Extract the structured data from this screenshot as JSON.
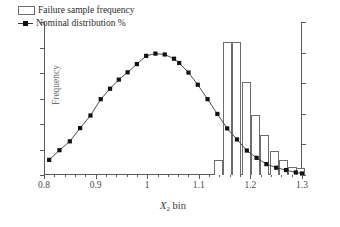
{
  "chart_data": {
    "type": "bar",
    "title": "",
    "subtitle": "",
    "xlabel": "X_2 bin",
    "xlabel_parts": {
      "italic": "X",
      "sub": "2",
      "rest": " bin"
    },
    "ylabel": "Frequency",
    "ylabel_right": "",
    "xlim": [
      0.8,
      1.3
    ],
    "ylim": [
      0,
      1800
    ],
    "ylim_right": [
      0,
      10
    ],
    "grid": false,
    "legend_position": "top-left",
    "xticks": [
      0.8,
      0.9,
      1.0,
      1.1,
      1.2,
      1.3
    ],
    "xtick_labels": [
      "0.8",
      "0.9",
      "1",
      "1.1",
      "1.2",
      "1.3"
    ],
    "xticks_minor_step": 0.02,
    "yticks": [
      0,
      300,
      600,
      900,
      1200,
      1500,
      1800
    ],
    "ytick_labels": [
      "0",
      "300",
      "600",
      "900",
      "1200",
      "1500",
      "1800"
    ],
    "yticks_right": [
      0,
      2,
      4,
      6,
      8,
      10
    ],
    "ytick_labels_right": [
      "0%",
      "2%",
      "4%",
      "6%",
      "8%",
      "10%"
    ],
    "right_axis_scale_note": "10% corresponds to 1800 on left axis",
    "series": [
      {
        "name": "Failure sample frequency",
        "type": "bar",
        "axis": "right",
        "marker": "open-rectangle",
        "color": "#ffffff",
        "edge_color": "#6d6d6d",
        "bin_width": 0.0175,
        "x": [
          1.138,
          1.156,
          1.174,
          1.192,
          1.21,
          1.228,
          1.246,
          1.264,
          1.282,
          1.297
        ],
        "values_percent": [
          0.95,
          8.7,
          8.7,
          6.05,
          3.95,
          2.6,
          1.55,
          0.95,
          0.55,
          0.45
        ],
        "values_frequency": [
          172,
          1568,
          1568,
          1092,
          712,
          468,
          280,
          172,
          100,
          80
        ]
      },
      {
        "name": "Nominal distribution %",
        "type": "line",
        "axis": "left",
        "marker": "filled-square",
        "color": "#3a3a3a",
        "marker_color": "#111111",
        "x": [
          0.81,
          0.83,
          0.85,
          0.87,
          0.89,
          0.91,
          0.928,
          0.945,
          0.962,
          0.98,
          0.998,
          1.016,
          1.034,
          1.052,
          1.062,
          1.08,
          1.098,
          1.117,
          1.136,
          1.155,
          1.174,
          1.193,
          1.212,
          1.231,
          1.25,
          1.269,
          1.288,
          1.3
        ],
        "values": [
          178,
          292,
          396,
          552,
          700,
          892,
          1015,
          1122,
          1208,
          1305,
          1402,
          1428,
          1418,
          1368,
          1318,
          1205,
          1062,
          892,
          718,
          548,
          418,
          288,
          202,
          128,
          86,
          58,
          30,
          18
        ]
      }
    ],
    "legend_entries": [
      {
        "label": "Failure sample frequency",
        "marker": "open-rectangle"
      },
      {
        "label": "Nominal distribution %",
        "marker": "line-with-square"
      }
    ],
    "colors": {
      "axis": "#5a5a5a",
      "bar_edge": "#6d6d6d",
      "bar_fill": "#ffffff",
      "line": "#3a3a3a",
      "marker": "#111111",
      "text": "#2b2b2b",
      "background": "#ffffff"
    }
  }
}
